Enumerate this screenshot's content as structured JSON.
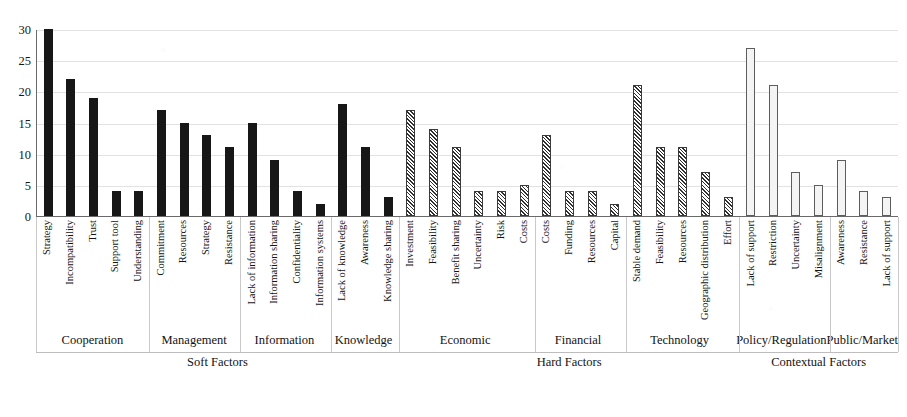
{
  "chart_data": {
    "type": "bar",
    "title": "",
    "xlabel": "",
    "ylabel": "",
    "ylim": [
      0,
      30
    ],
    "ytick_values": [
      0,
      5,
      10,
      15,
      20,
      25,
      30
    ],
    "ytick_labels": [
      "0",
      "5",
      "10",
      "15",
      "20",
      "25",
      "30"
    ],
    "grid": true,
    "legend": "none",
    "categories": [
      "Strategy",
      "Incompatibility",
      "Trust",
      "Support tool",
      "Understanding",
      "Commitment",
      "Resources",
      "Strategy",
      "Resistance",
      "Lack of information",
      "Information sharing",
      "Confidentiality",
      "Information systems",
      "Lack of knowledge",
      "Awareness",
      "Knowledge sharing",
      "Investment",
      "Feasibility",
      "Benefit sharing",
      "Uncertainty",
      "Risk",
      "Costs",
      "Costs",
      "Funding",
      "Resources",
      "Capital",
      "Stable demand",
      "Feasibility",
      "Resources",
      "Geographic distribution",
      "Effort",
      "Lack of support",
      "Restriction",
      "Uncertainty",
      "Misalignment",
      "Awareness",
      "Resistance",
      "Lack of support"
    ],
    "values": [
      30,
      22,
      19,
      4,
      4,
      17,
      15,
      13,
      11,
      15,
      9,
      4,
      2,
      18,
      11,
      3,
      17,
      14,
      11,
      4,
      4,
      5,
      13,
      4,
      4,
      2,
      21,
      11,
      11,
      7,
      3,
      27,
      21,
      7,
      5,
      9,
      4,
      3
    ],
    "bar_styles": [
      "solid",
      "solid",
      "solid",
      "solid",
      "solid",
      "solid",
      "solid",
      "solid",
      "solid",
      "solid",
      "solid",
      "solid",
      "solid",
      "solid",
      "solid",
      "solid",
      "hatch",
      "hatch",
      "hatch",
      "hatch",
      "hatch",
      "hatch",
      "hatch",
      "hatch",
      "hatch",
      "hatch",
      "hatch",
      "hatch",
      "hatch",
      "hatch",
      "hatch",
      "open",
      "open",
      "open",
      "open",
      "open",
      "open",
      "open"
    ],
    "groups_level1": [
      {
        "label": "Cooperation",
        "span": 5
      },
      {
        "label": "Management",
        "span": 4
      },
      {
        "label": "Information",
        "span": 4
      },
      {
        "label": "Knowledge",
        "span": 3
      },
      {
        "label": "Economic",
        "span": 6
      },
      {
        "label": "Financial",
        "span": 4
      },
      {
        "label": "Technology",
        "span": 5
      },
      {
        "label": "Policy/Regulation",
        "span": 4
      },
      {
        "label": "Public/Market",
        "span": 3
      }
    ],
    "groups_level2": [
      {
        "label": "Soft Factors",
        "span": 16
      },
      {
        "label": "Hard Factors",
        "span": 15
      },
      {
        "label": "Contextual Factors",
        "span": 7
      }
    ]
  },
  "colors": {
    "bar_solid": "#171717",
    "bar_hatch_line": "#2e2e2e",
    "bar_open_fill": "#f4f4f4",
    "bar_open_border": "#5d5d5d",
    "axis": "#6a6a6a",
    "gridline": "#e2e2e2",
    "text": "#131313",
    "background": "#ffffff"
  }
}
